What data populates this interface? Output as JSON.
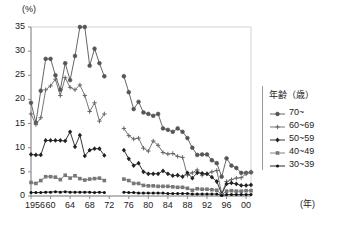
{
  "chart_data": {
    "type": "line",
    "title": "",
    "xlabel": "年",
    "ylabel": "(%)",
    "ylim": [
      0,
      35
    ],
    "ytick_labels": [
      "0",
      "5",
      "10",
      "15",
      "20",
      "25",
      "30",
      "35"
    ],
    "ytick_values": [
      0,
      5,
      10,
      15,
      20,
      25,
      30,
      35
    ],
    "xlim": [
      1956,
      2001
    ],
    "xtick_labels": [
      "1956",
      "60",
      "64",
      "68",
      "72",
      "76",
      "80",
      "84",
      "88",
      "92",
      "96",
      "00"
    ],
    "xtick_values": [
      1956,
      1960,
      1964,
      1968,
      1972,
      1976,
      1980,
      1984,
      1988,
      1992,
      1996,
      2000
    ],
    "grid": false,
    "legend_position": "right",
    "legend_title": "年齢（歳）",
    "data_gap_years": [
      1972,
      1973,
      1974
    ],
    "series": [
      {
        "name": "70~",
        "marker": "circle",
        "color": "#555555",
        "x": [
          1956,
          1957,
          1958,
          1959,
          1960,
          1961,
          1962,
          1963,
          1964,
          1965,
          1966,
          1967,
          1968,
          1969,
          1970,
          1971,
          1975,
          1976,
          1977,
          1978,
          1979,
          1980,
          1981,
          1982,
          1983,
          1984,
          1985,
          1986,
          1987,
          1988,
          1989,
          1990,
          1991,
          1992,
          1993,
          1994,
          1995,
          1996,
          1997,
          1998,
          1999,
          2000,
          2001
        ],
        "values": [
          19.3,
          15.2,
          21.8,
          28.4,
          28.4,
          25.0,
          22.0,
          27.5,
          24.0,
          29.0,
          35.0,
          35.0,
          27.0,
          30.5,
          27.5,
          24.8,
          24.8,
          21.5,
          18.0,
          19.5,
          17.3,
          17.0,
          16.6,
          17.0,
          14.0,
          13.7,
          13.3,
          14.0,
          13.3,
          12.0,
          10.0,
          8.5,
          8.6,
          8.6,
          7.4,
          6.8,
          4.0,
          7.8,
          6.3,
          5.8,
          4.8,
          4.8,
          4.9
        ]
      },
      {
        "name": "60~69",
        "marker": "cross",
        "color": "#666666",
        "x": [
          1956,
          1957,
          1958,
          1959,
          1960,
          1961,
          1962,
          1963,
          1964,
          1965,
          1966,
          1967,
          1968,
          1969,
          1970,
          1971,
          1975,
          1976,
          1977,
          1978,
          1979,
          1980,
          1981,
          1982,
          1983,
          1984,
          1985,
          1986,
          1987,
          1988,
          1989,
          1990,
          1991,
          1992,
          1993,
          1994,
          1995,
          1996,
          1997,
          1998,
          1999,
          2000,
          2001
        ],
        "values": [
          17.0,
          14.8,
          16.2,
          22.0,
          22.8,
          24.2,
          20.8,
          24.5,
          22.5,
          22.0,
          23.0,
          20.8,
          17.5,
          19.3,
          15.5,
          17.0,
          14.0,
          12.5,
          11.8,
          12.0,
          9.9,
          9.3,
          11.4,
          10.5,
          9.0,
          8.7,
          8.8,
          8.2,
          8.0,
          4.3,
          4.8,
          5.4,
          4.3,
          4.6,
          5.0,
          5.3,
          0.5,
          3.0,
          3.4,
          3.7,
          3.8,
          4.6,
          5.0
        ]
      },
      {
        "name": "50~59",
        "marker": "diamond",
        "color": "#222222",
        "x": [
          1956,
          1957,
          1958,
          1959,
          1960,
          1961,
          1962,
          1963,
          1964,
          1965,
          1966,
          1967,
          1968,
          1969,
          1970,
          1971,
          1975,
          1976,
          1977,
          1978,
          1979,
          1980,
          1981,
          1982,
          1983,
          1984,
          1985,
          1986,
          1987,
          1988,
          1989,
          1990,
          1991,
          1992,
          1993,
          1994,
          1995,
          1996,
          1997,
          1998,
          1999,
          2000,
          2001
        ],
        "values": [
          8.6,
          8.5,
          8.5,
          11.5,
          11.5,
          11.5,
          11.5,
          11.4,
          13.3,
          10.2,
          12.6,
          8.3,
          9.5,
          9.8,
          9.8,
          8.4,
          9.5,
          7.7,
          6.3,
          6.8,
          5.0,
          4.6,
          4.6,
          4.6,
          5.2,
          4.6,
          4.2,
          4.3,
          4.0,
          4.8,
          3.7,
          4.8,
          4.7,
          4.6,
          3.9,
          3.0,
          0.4,
          2.5,
          2.7,
          2.5,
          2.2,
          2.2,
          2.3
        ]
      },
      {
        "name": "40~49",
        "marker": "square",
        "color": "#777777",
        "x": [
          1956,
          1957,
          1958,
          1959,
          1960,
          1961,
          1962,
          1963,
          1964,
          1965,
          1966,
          1967,
          1968,
          1969,
          1970,
          1971,
          1975,
          1976,
          1977,
          1978,
          1979,
          1980,
          1981,
          1982,
          1983,
          1984,
          1985,
          1986,
          1987,
          1988,
          1989,
          1990,
          1991,
          1992,
          1993,
          1994,
          1995,
          1996,
          1997,
          1998,
          1999,
          2000,
          2001
        ],
        "values": [
          2.8,
          2.6,
          3.2,
          4.0,
          4.0,
          3.9,
          3.4,
          4.3,
          3.7,
          4.2,
          3.6,
          3.3,
          3.5,
          3.6,
          3.7,
          3.2,
          3.5,
          3.2,
          2.6,
          2.6,
          2.2,
          2.1,
          2.1,
          2.0,
          2.0,
          2.0,
          1.9,
          1.8,
          1.8,
          1.6,
          1.2,
          1.5,
          1.4,
          1.4,
          1.3,
          1.2,
          0.3,
          1.0,
          1.1,
          1.0,
          1.0,
          1.1,
          1.1
        ]
      },
      {
        "name": "30~39",
        "marker": "dot",
        "color": "#111111",
        "x": [
          1956,
          1957,
          1958,
          1959,
          1960,
          1961,
          1962,
          1963,
          1964,
          1965,
          1966,
          1967,
          1968,
          1969,
          1970,
          1971,
          1975,
          1976,
          1977,
          1978,
          1979,
          1980,
          1981,
          1982,
          1983,
          1984,
          1985,
          1986,
          1987,
          1988,
          1989,
          1990,
          1991,
          1992,
          1993,
          1994,
          1995,
          1996,
          1997,
          1998,
          1999,
          2000,
          2001
        ],
        "values": [
          0.7,
          0.7,
          0.7,
          0.8,
          0.8,
          0.9,
          0.8,
          0.9,
          0.8,
          0.8,
          0.8,
          0.8,
          0.8,
          0.7,
          0.8,
          0.7,
          0.8,
          0.7,
          0.7,
          0.6,
          0.6,
          0.6,
          0.6,
          0.6,
          0.6,
          0.5,
          0.5,
          0.5,
          0.5,
          0.5,
          0.4,
          0.4,
          0.4,
          0.4,
          0.4,
          0.4,
          0.1,
          0.3,
          0.3,
          0.3,
          0.3,
          0.3,
          0.3
        ]
      }
    ]
  },
  "axes": {
    "y_unit_label": "(%)",
    "x_unit_label": "(年)"
  }
}
